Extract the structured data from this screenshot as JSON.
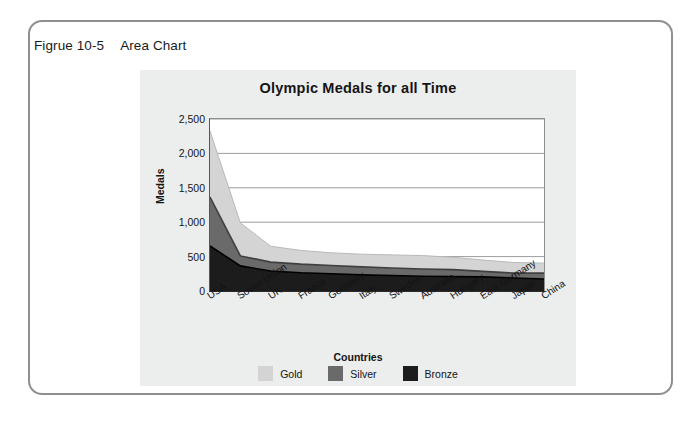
{
  "figure": {
    "number": "Figrue 10-5",
    "caption": "Area Chart"
  },
  "colors": {
    "gold": "#d4d4d4",
    "silver": "#6a6a6a",
    "bronze": "#1c1c1c",
    "panel_bg": "#eceded",
    "plot_bg": "#ffffff",
    "gridline": "#9a9c9e",
    "frame_border": "#8d8f91"
  },
  "legend": {
    "position": "bottom",
    "items": [
      {
        "label": "Gold",
        "color": "#d4d4d4"
      },
      {
        "label": "Silver",
        "color": "#6a6a6a"
      },
      {
        "label": "Bronze",
        "color": "#1c1c1c"
      }
    ]
  },
  "chart_data": {
    "type": "area",
    "stacked": true,
    "title": "Olympic Medals for all Time",
    "xlabel": "Countries",
    "ylabel": "Medals",
    "ylim": [
      0,
      2500
    ],
    "yticks": [
      0,
      500,
      1000,
      1500,
      2000,
      2500
    ],
    "ytick_labels": [
      "0",
      "500",
      "1,000",
      "1,500",
      "2,000",
      "2,500"
    ],
    "grid": true,
    "categories": [
      "USA",
      "Soviet Union",
      "UK",
      "France",
      "Germany",
      "Italy",
      "Sweden",
      "Australia",
      "Hungary",
      "East Germany",
      "Japan",
      "China"
    ],
    "series": [
      {
        "name": "Bronze",
        "color": "#1c1c1c",
        "values": [
          655,
          365,
          290,
          265,
          250,
          235,
          225,
          215,
          210,
          205,
          190,
          175
        ]
      },
      {
        "name": "Silver",
        "color": "#6a6a6a",
        "values": [
          710,
          145,
          130,
          125,
          120,
          115,
          110,
          105,
          100,
          80,
          70,
          85
        ]
      },
      {
        "name": "Gold",
        "color": "#d4d4d4",
        "values": [
          960,
          480,
          230,
          200,
          185,
          185,
          190,
          195,
          180,
          165,
          155,
          145
        ]
      }
    ],
    "series_totals": [
      2325,
      990,
      650,
      590,
      555,
      535,
      525,
      515,
      490,
      450,
      415,
      405
    ]
  }
}
